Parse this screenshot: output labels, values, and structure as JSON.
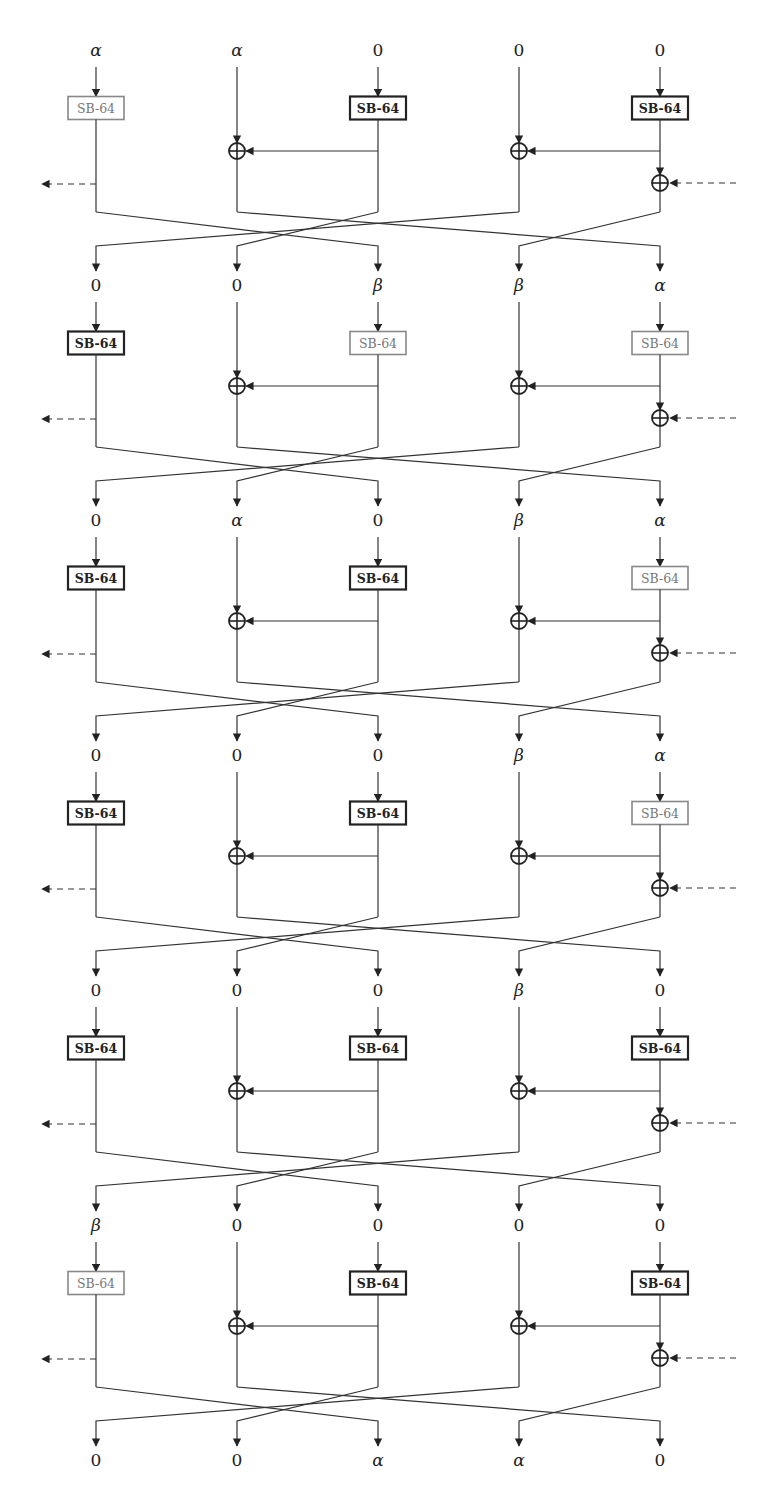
{
  "figure": {
    "sbox_label": "SB-64",
    "columns": 5,
    "permutation": [
      2,
      4,
      1,
      0,
      3
    ],
    "colors": {
      "wire": "#333333",
      "active_box": "#888888",
      "inactive_box": "#222222",
      "background": "#ffffff"
    },
    "rounds": [
      {
        "inputs": [
          "α",
          "α",
          "0",
          "0",
          "0"
        ],
        "active_boxes": [
          true,
          false,
          false
        ]
      },
      {
        "inputs": [
          "0",
          "0",
          "β",
          "β",
          "α"
        ],
        "active_boxes": [
          false,
          true,
          true
        ]
      },
      {
        "inputs": [
          "0",
          "α",
          "0",
          "β",
          "α"
        ],
        "active_boxes": [
          false,
          false,
          true
        ]
      },
      {
        "inputs": [
          "0",
          "0",
          "0",
          "β",
          "α"
        ],
        "active_boxes": [
          false,
          false,
          true
        ]
      },
      {
        "inputs": [
          "0",
          "0",
          "0",
          "β",
          "0"
        ],
        "active_boxes": [
          false,
          false,
          false
        ]
      },
      {
        "inputs": [
          "β",
          "0",
          "0",
          "0",
          "0"
        ],
        "active_boxes": [
          true,
          false,
          false
        ]
      }
    ],
    "outputs": [
      "0",
      "0",
      "α",
      "α",
      "0"
    ]
  }
}
